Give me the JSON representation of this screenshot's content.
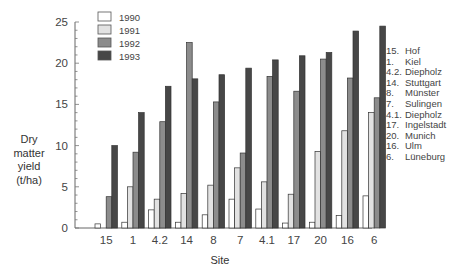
{
  "chart_data": {
    "type": "bar",
    "title": "",
    "xlabel": "Site",
    "ylabel": "Dry matter yield (t/ha)",
    "ylabel_lines": [
      "Dry",
      "matter",
      "yield",
      "(t/ha)"
    ],
    "ylim": [
      0,
      25
    ],
    "yticks": [
      0,
      5,
      10,
      15,
      20,
      25
    ],
    "grid": false,
    "legend_position": "top-left (inside)",
    "categories": [
      "15",
      "1",
      "4.2",
      "14",
      "8",
      "7",
      "4.1",
      "17",
      "20",
      "16",
      "6"
    ],
    "series": [
      {
        "name": "1990",
        "color": "#ffffff",
        "values": [
          0.5,
          0.7,
          2.2,
          0.7,
          1.6,
          3.5,
          2.3,
          0.6,
          0.7,
          1.5,
          3.9
        ]
      },
      {
        "name": "1991",
        "color": "#e2e2e2",
        "values": [
          0,
          5.0,
          3.5,
          4.2,
          5.2,
          7.3,
          5.6,
          4.1,
          9.3,
          11.8,
          14.0
        ]
      },
      {
        "name": "1992",
        "color": "#8c8c8c",
        "values": [
          3.8,
          9.2,
          12.9,
          22.5,
          15.3,
          9.1,
          18.4,
          16.6,
          20.5,
          18.2,
          15.8
        ]
      },
      {
        "name": "1993",
        "color": "#474747",
        "values": [
          10.0,
          14.0,
          17.2,
          18.1,
          18.6,
          19.4,
          20.4,
          20.9,
          21.3,
          23.9,
          24.5
        ]
      }
    ],
    "annotations": {
      "site_key": [
        {
          "num": "15.",
          "name": "Hof"
        },
        {
          "num": "1.",
          "name": "Kiel"
        },
        {
          "num": "4.2.",
          "name": "Diepholz"
        },
        {
          "num": "14.",
          "name": "Stuttgart"
        },
        {
          "num": "8.",
          "name": "Münster"
        },
        {
          "num": "7.",
          "name": "Sulingen"
        },
        {
          "num": "4.1.",
          "name": "Diepholz"
        },
        {
          "num": "17.",
          "name": "Ingelstadt"
        },
        {
          "num": "20.",
          "name": "Munich"
        },
        {
          "num": "16.",
          "name": "Ulm"
        },
        {
          "num": "6.",
          "name": "Lüneburg"
        }
      ]
    }
  },
  "legend": {
    "items": [
      {
        "label": "1990",
        "color": "#ffffff"
      },
      {
        "label": "1991",
        "color": "#e2e2e2"
      },
      {
        "label": "1992",
        "color": "#8c8c8c"
      },
      {
        "label": "1993",
        "color": "#474747"
      }
    ]
  }
}
